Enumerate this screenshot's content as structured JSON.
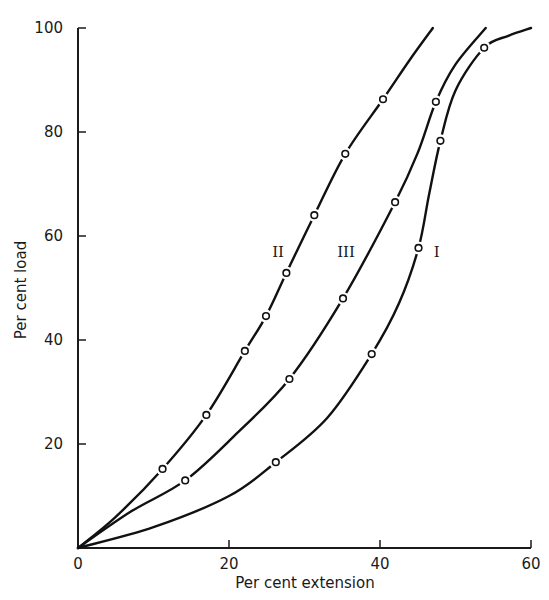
{
  "chart_data": {
    "type": "line",
    "title": "",
    "xlabel": "Per cent extension",
    "ylabel": "Per cent load",
    "xlim": [
      0,
      60
    ],
    "ylim": [
      0,
      100
    ],
    "x_ticks": [
      0,
      20,
      40,
      60
    ],
    "y_ticks": [
      0,
      20,
      40,
      60,
      80,
      100
    ],
    "x_tick_labels": [
      "0",
      "20",
      "40",
      "60"
    ],
    "y_tick_labels": [
      "",
      "20",
      "40",
      "60",
      "80",
      "100"
    ],
    "origin_label": "0",
    "grid": false,
    "legend": "none (curves labeled inline)",
    "series": [
      {
        "name": "I",
        "label_pos": [
          47.5,
          56
        ],
        "curve": [
          [
            0,
            0
          ],
          [
            10,
            4
          ],
          [
            20,
            10
          ],
          [
            26.2,
            16.5
          ],
          [
            33,
            25
          ],
          [
            38.9,
            37.3
          ],
          [
            42.5,
            47
          ],
          [
            45.1,
            57.7
          ],
          [
            46.5,
            68
          ],
          [
            48,
            78.3
          ],
          [
            50,
            88
          ],
          [
            53.8,
            96.2
          ],
          [
            57,
            98.5
          ],
          [
            60,
            100
          ]
        ],
        "markers": [
          [
            26.2,
            16.5
          ],
          [
            38.9,
            37.3
          ],
          [
            45.1,
            57.7
          ],
          [
            48,
            78.3
          ],
          [
            53.8,
            96.2
          ]
        ]
      },
      {
        "name": "II",
        "label_pos": [
          26.5,
          56
        ],
        "curve": [
          [
            0,
            0
          ],
          [
            5,
            6
          ],
          [
            11.2,
            15.2
          ],
          [
            17,
            25.6
          ],
          [
            22.1,
            37.9
          ],
          [
            24.9,
            44.6
          ],
          [
            27.6,
            52.9
          ],
          [
            31.3,
            64
          ],
          [
            35.4,
            75.8
          ],
          [
            40.4,
            86.3
          ],
          [
            44,
            94
          ],
          [
            47,
            100
          ]
        ],
        "markers": [
          [
            11.2,
            15.2
          ],
          [
            17,
            25.6
          ],
          [
            22.1,
            37.9
          ],
          [
            24.9,
            44.6
          ],
          [
            27.6,
            52.9
          ],
          [
            31.3,
            64
          ],
          [
            35.4,
            75.8
          ],
          [
            40.4,
            86.3
          ]
        ]
      },
      {
        "name": "III",
        "label_pos": [
          35.5,
          56
        ],
        "curve": [
          [
            0,
            0
          ],
          [
            7,
            7
          ],
          [
            14.2,
            13
          ],
          [
            21,
            22
          ],
          [
            28,
            32.5
          ],
          [
            35.1,
            48
          ],
          [
            42,
            66.5
          ],
          [
            45,
            76
          ],
          [
            47.4,
            85.8
          ],
          [
            50,
            93
          ],
          [
            54,
            100
          ]
        ],
        "markers": [
          [
            14.2,
            13
          ],
          [
            28,
            32.5
          ],
          [
            35.1,
            48
          ],
          [
            42,
            66.5
          ],
          [
            47.4,
            85.8
          ]
        ]
      }
    ]
  }
}
